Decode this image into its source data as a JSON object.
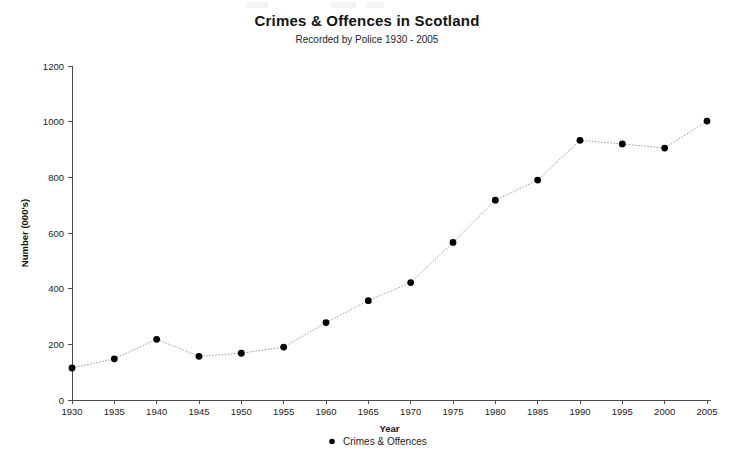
{
  "chart_data": {
    "type": "line",
    "title": "Crimes & Offences in Scotland",
    "subtitle": "Recorded by Police 1930 - 2005",
    "xlabel": "Year",
    "ylabel": "Number (000's)",
    "xlim": [
      1930,
      2005
    ],
    "ylim": [
      0,
      1200
    ],
    "ytick_step": 200,
    "xtick_step": 5,
    "grid": false,
    "legend_position": "bottom-center",
    "x": [
      1930,
      1935,
      1940,
      1945,
      1950,
      1955,
      1960,
      1965,
      1970,
      1975,
      1980,
      1985,
      1990,
      1995,
      2000,
      2005
    ],
    "xticklabels": [
      "1930",
      "1935",
      "1940",
      "1945",
      "1950",
      "1955",
      "1960",
      "1965",
      "1970",
      "1975",
      "1980",
      "1985",
      "1990",
      "1995",
      "2000",
      "2005"
    ],
    "yticklabels": [
      "0",
      "200",
      "400",
      "600",
      "800",
      "1000",
      "1200"
    ],
    "yticks": [
      0,
      200,
      400,
      600,
      800,
      1000,
      1200
    ],
    "series": [
      {
        "name": "Crimes & Offences",
        "marker": "circle",
        "marker_color": "#000000",
        "line_color": "#9a9a9a",
        "line_style": "dotted",
        "values": [
          115,
          148,
          218,
          157,
          168,
          190,
          278,
          357,
          422,
          566,
          718,
          790,
          933,
          920,
          905,
          1002
        ]
      }
    ]
  },
  "legend": {
    "entries": [
      {
        "label": "Crimes & Offences",
        "marker": "dot-marker"
      }
    ]
  },
  "colors": {
    "marker": "#000000",
    "line": "#9a9a9a",
    "axis": "#4a4a4a",
    "text": "#1c1c1c",
    "background": "#ffffff"
  }
}
